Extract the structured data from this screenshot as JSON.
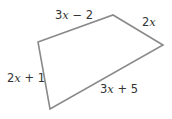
{
  "figure": {
    "shape": "quadrilateral",
    "stroke_color": "#8a8a8a",
    "text_color": "#333333",
    "vertices": {
      "A": [
        38,
        42
      ],
      "B": [
        113,
        15
      ],
      "C": [
        163,
        45
      ],
      "D": [
        50,
        109
      ]
    },
    "sides": [
      {
        "id": "top",
        "from": "A",
        "to": "B",
        "coef": "3",
        "var": "x",
        "rest": " − 2",
        "label": "3x − 2"
      },
      {
        "id": "right",
        "from": "B",
        "to": "C",
        "coef": "2",
        "var": "x",
        "rest": "",
        "label": "2x"
      },
      {
        "id": "bottom",
        "from": "C",
        "to": "D",
        "coef": "3",
        "var": "x",
        "rest": " + 5",
        "label": "3x + 5"
      },
      {
        "id": "left",
        "from": "D",
        "to": "A",
        "coef": "2",
        "var": "x",
        "rest": " + 1",
        "label": "2x + 1"
      }
    ]
  }
}
